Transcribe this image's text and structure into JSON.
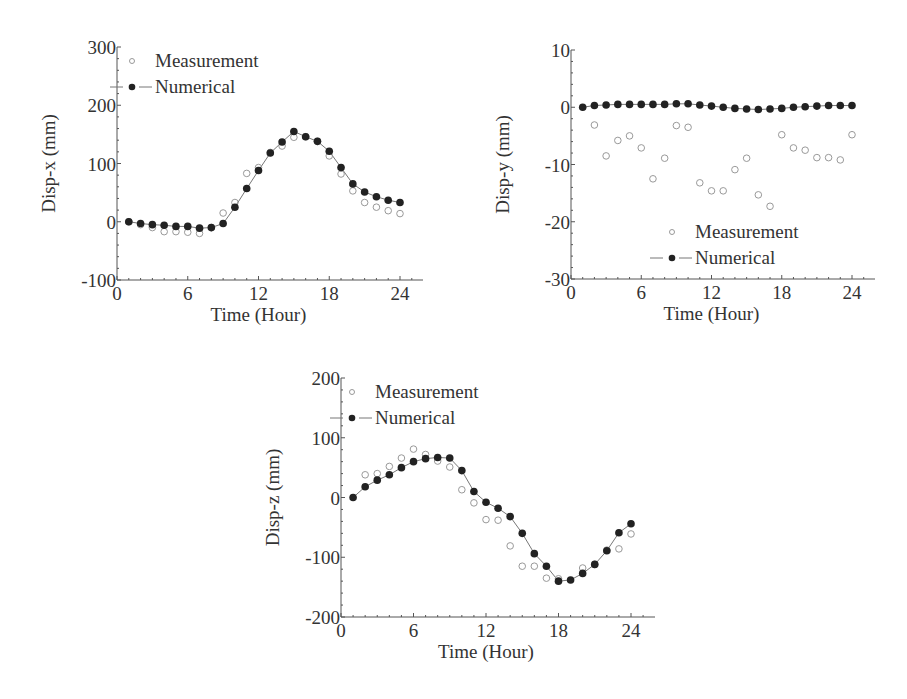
{
  "chart_data": [
    {
      "id": "disp-x",
      "type": "line",
      "title": "",
      "xlabel": "Time (Hour)",
      "ylabel": "Disp-x (mm)",
      "xlim": [
        0,
        26
      ],
      "ylim": [
        -100,
        300
      ],
      "xticks": [
        0,
        6,
        12,
        18,
        24
      ],
      "yticks": [
        -100,
        0,
        100,
        200,
        300
      ],
      "grid": false,
      "legend_position": "upper-left",
      "legend": [
        "Measurement",
        "Numerical"
      ],
      "series": [
        {
          "name": "Measurement",
          "style": "open-circle",
          "x": [
            1,
            2,
            3,
            4,
            5,
            6,
            7,
            8,
            9,
            10,
            11,
            12,
            13,
            14,
            15,
            16,
            17,
            18,
            19,
            20,
            21,
            22,
            23,
            24
          ],
          "values": [
            0,
            -5,
            -10,
            -17,
            -17,
            -18,
            -20,
            -10,
            15,
            33,
            83,
            93,
            119,
            130,
            145,
            146,
            138,
            113,
            82,
            53,
            33,
            25,
            19,
            14
          ]
        },
        {
          "name": "Numerical",
          "style": "filled-circle-line",
          "x": [
            1,
            2,
            3,
            4,
            5,
            6,
            7,
            8,
            9,
            10,
            11,
            12,
            13,
            14,
            15,
            16,
            17,
            18,
            19,
            20,
            21,
            22,
            23,
            24
          ],
          "values": [
            0,
            -3,
            -5,
            -6,
            -8,
            -8,
            -11,
            -10,
            -3,
            25,
            57,
            88,
            118,
            137,
            155,
            146,
            138,
            121,
            93,
            65,
            51,
            43,
            37,
            33
          ]
        }
      ]
    },
    {
      "id": "disp-y",
      "type": "line",
      "title": "",
      "xlabel": "Time (Hour)",
      "ylabel": "Disp-y (mm)",
      "xlim": [
        0,
        26
      ],
      "ylim": [
        -30,
        10
      ],
      "xticks": [
        0,
        6,
        12,
        18,
        24
      ],
      "yticks": [
        -30,
        -20,
        -10,
        0,
        10
      ],
      "grid": false,
      "legend_position": "lower-right",
      "legend": [
        "Measurement",
        "Numerical"
      ],
      "series": [
        {
          "name": "Measurement",
          "style": "open-circle",
          "x": [
            2,
            3,
            4,
            5,
            6,
            7,
            8,
            9,
            10,
            11,
            12,
            13,
            14,
            15,
            16,
            17,
            18,
            19,
            20,
            21,
            22,
            23,
            24
          ],
          "values": [
            -3.1,
            -8.5,
            -5.8,
            -5.0,
            -7.1,
            -12.5,
            -8.9,
            -3.2,
            -3.5,
            -13.2,
            -14.6,
            -14.6,
            -10.9,
            -8.9,
            -15.3,
            -17.3,
            -4.8,
            -7.1,
            -7.5,
            -8.8,
            -8.8,
            -9.2,
            -4.8
          ]
        },
        {
          "name": "Numerical",
          "style": "filled-circle-line",
          "x": [
            1,
            2,
            3,
            4,
            5,
            6,
            7,
            8,
            9,
            10,
            11,
            12,
            13,
            14,
            15,
            16,
            17,
            18,
            19,
            20,
            21,
            22,
            23,
            24
          ],
          "values": [
            0.0,
            0.3,
            0.4,
            0.5,
            0.5,
            0.5,
            0.5,
            0.5,
            0.6,
            0.6,
            0.4,
            0.2,
            0.0,
            -0.2,
            -0.3,
            -0.4,
            -0.3,
            -0.2,
            0.0,
            0.1,
            0.2,
            0.3,
            0.3,
            0.3
          ]
        }
      ]
    },
    {
      "id": "disp-z",
      "type": "line",
      "title": "",
      "xlabel": "Time (Hour)",
      "ylabel": "Disp-z (mm)",
      "xlim": [
        0,
        26
      ],
      "ylim": [
        -200,
        200
      ],
      "xticks": [
        0,
        6,
        12,
        18,
        24
      ],
      "yticks": [
        -200,
        -100,
        0,
        100,
        200
      ],
      "grid": false,
      "legend_position": "upper-left",
      "legend": [
        "Measurement",
        "Numerical"
      ],
      "series": [
        {
          "name": "Measurement",
          "style": "open-circle",
          "x": [
            2,
            3,
            4,
            5,
            6,
            7,
            8,
            9,
            10,
            11,
            12,
            13,
            14,
            15,
            16,
            17,
            18,
            20,
            21,
            22,
            23,
            24
          ],
          "values": [
            38,
            40,
            52,
            66,
            81,
            72,
            61,
            51,
            13,
            -9,
            -37,
            -38,
            -81,
            -115,
            -115,
            -135,
            -136,
            -118,
            -112,
            -88,
            -86,
            -61
          ]
        },
        {
          "name": "Numerical",
          "style": "filled-circle-line",
          "x": [
            1,
            2,
            3,
            4,
            5,
            6,
            7,
            8,
            9,
            10,
            11,
            12,
            13,
            14,
            15,
            16,
            17,
            18,
            19,
            20,
            21,
            22,
            23,
            24
          ],
          "values": [
            0,
            18,
            29,
            38,
            50,
            60,
            65,
            67,
            66,
            45,
            10,
            -8,
            -18,
            -32,
            -60,
            -94,
            -115,
            -140,
            -138,
            -127,
            -112,
            -89,
            -59,
            -44
          ]
        }
      ]
    }
  ],
  "legend_labels": {
    "measurement": "Measurement",
    "numerical": "Numerical"
  },
  "colors": {
    "axis": "#555555",
    "line": "#777777",
    "filled_marker": "#222222",
    "open_marker": "#999999",
    "text": "#333333"
  }
}
